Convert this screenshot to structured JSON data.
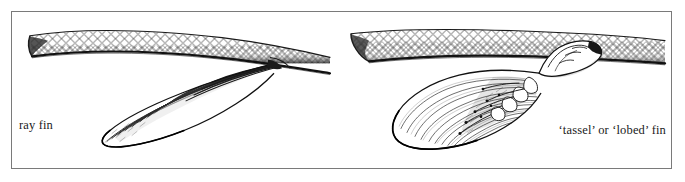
{
  "figure": {
    "kind": "scientific-line-illustration",
    "frame_color": "#7a7a7a",
    "background_color": "#ffffff",
    "ink_color": "#1a1a1a",
    "panel_count": 2
  },
  "panels": [
    {
      "id": "ray-fin",
      "caption": "ray fin",
      "caption_position": "bottom-left",
      "description": "tail section of a ray-finned fish with diamond cross-hatched scales and a broad fan-shaped fin of fine parallel rays converging to a narrow base"
    },
    {
      "id": "lobed-fin",
      "caption": "‘tassel’ or ‘lobed’ fin",
      "caption_position": "bottom-right",
      "description": "tail section of a lobe-finned fish with diamond cross-hatched scales and a fleshy lobed fin showing internal skeletal elements at the base"
    }
  ],
  "colors": {
    "frame": "#7a7a7a",
    "ink": "#1a1a1a",
    "paper": "#ffffff",
    "shading": "#555555"
  }
}
